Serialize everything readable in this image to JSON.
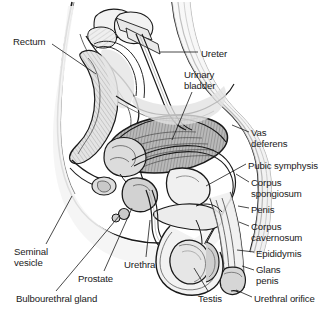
{
  "figure": {
    "background_color": "#ffffff",
    "ink_color": "#1a1a1a",
    "shade_light": "#f0f0f0",
    "shade_mid": "#d8d8d8",
    "shade_dark": "#9a9a9a",
    "hatch_color": "#8a8a8a",
    "width": 333,
    "height": 316
  },
  "labels": [
    {
      "id": "rectum",
      "text": "Rectum",
      "x": 13,
      "y": 36,
      "align": "left"
    },
    {
      "id": "ureter",
      "text": "Ureter",
      "x": 201,
      "y": 48,
      "align": "left"
    },
    {
      "id": "urinary_bladder_l1",
      "text": "Urinary",
      "x": 184,
      "y": 69,
      "align": "left"
    },
    {
      "id": "urinary_bladder_l2",
      "text": "bladder",
      "x": 184,
      "y": 80,
      "align": "left"
    },
    {
      "id": "vas_deferens_l1",
      "text": "Vas",
      "x": 251,
      "y": 127,
      "align": "left"
    },
    {
      "id": "vas_deferens_l2",
      "text": "deferens",
      "x": 251,
      "y": 138,
      "align": "left"
    },
    {
      "id": "pubic_symphysis",
      "text": "Pubic symphysis",
      "x": 248,
      "y": 160,
      "align": "left"
    },
    {
      "id": "corpus_spongiosum_l1",
      "text": "Corpus",
      "x": 251,
      "y": 177,
      "align": "left"
    },
    {
      "id": "corpus_spongiosum_l2",
      "text": "spongiosum",
      "x": 251,
      "y": 188,
      "align": "left"
    },
    {
      "id": "penis",
      "text": "Penis",
      "x": 251,
      "y": 204,
      "align": "left"
    },
    {
      "id": "corpus_cavernosum_l1",
      "text": "Corpus",
      "x": 251,
      "y": 221,
      "align": "left"
    },
    {
      "id": "corpus_cavernosum_l2",
      "text": "cavernosum",
      "x": 251,
      "y": 232,
      "align": "left"
    },
    {
      "id": "epididymis",
      "text": "Epididymis",
      "x": 256,
      "y": 248,
      "align": "left"
    },
    {
      "id": "glans_penis_l1",
      "text": "Glans",
      "x": 256,
      "y": 264,
      "align": "left"
    },
    {
      "id": "glans_penis_l2",
      "text": "penis",
      "x": 256,
      "y": 275,
      "align": "left"
    },
    {
      "id": "urethral_orifice",
      "text": "Urethral orifice",
      "x": 254,
      "y": 293,
      "align": "left"
    },
    {
      "id": "seminal_vesicle_l1",
      "text": "Seminal",
      "x": 14,
      "y": 246,
      "align": "left"
    },
    {
      "id": "seminal_vesicle_l2",
      "text": "vesicle",
      "x": 14,
      "y": 257,
      "align": "left"
    },
    {
      "id": "urethra",
      "text": "Urethra",
      "x": 124,
      "y": 259,
      "align": "left"
    },
    {
      "id": "prostate",
      "text": "Prostate",
      "x": 78,
      "y": 273,
      "align": "left"
    },
    {
      "id": "bulbourethral_gland",
      "text": "Bulbourethral gland",
      "x": 16,
      "y": 293,
      "align": "left"
    },
    {
      "id": "testis",
      "text": "Testis",
      "x": 198,
      "y": 293,
      "align": "left"
    }
  ],
  "structures": [
    "rectum",
    "ureter",
    "urinary bladder",
    "vas deferens",
    "pubic symphysis",
    "corpus spongiosum",
    "penis",
    "corpus cavernosum",
    "epididymis",
    "glans penis",
    "urethral orifice",
    "seminal vesicle",
    "urethra",
    "prostate",
    "bulbourethral gland",
    "testis"
  ]
}
